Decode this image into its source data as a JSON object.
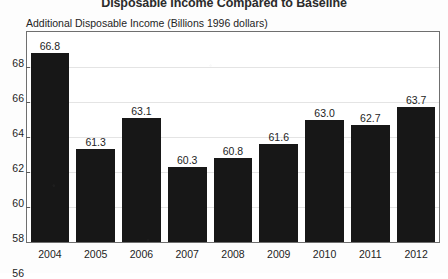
{
  "chart_data": {
    "type": "bar",
    "title": "Disposable Income Compared to Baseline",
    "subtitle": "Additional Disposable Income (Billions 1996 dollars)",
    "xlabel": "",
    "ylabel": "",
    "categories": [
      "2004",
      "2005",
      "2006",
      "2007",
      "2008",
      "2009",
      "2010",
      "2011",
      "2012"
    ],
    "values": [
      66.8,
      61.3,
      63.1,
      60.3,
      60.8,
      61.6,
      63.0,
      62.7,
      63.7
    ],
    "value_labels": [
      "66.8",
      "61.3",
      "63.1",
      "60.3",
      "60.8",
      "61.6",
      "63.0",
      "62.7",
      "63.7"
    ],
    "ylim": [
      56,
      68
    ],
    "y_ticks": [
      56,
      58,
      60,
      62,
      64,
      66,
      68
    ],
    "y_tick_labels": [
      "56",
      "58",
      "60",
      "62",
      "64",
      "66",
      "68"
    ],
    "grid": true,
    "legend": null,
    "bar_color": "#171717",
    "frame_color": "#6f6f6f",
    "background_color": "#fdfdfd"
  }
}
